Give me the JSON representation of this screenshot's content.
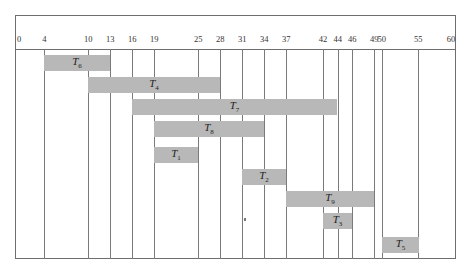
{
  "chart_data": {
    "type": "gantt",
    "title": "",
    "xlabel": "",
    "ylabel": "",
    "xlim": [
      0,
      60
    ],
    "grid": true,
    "tick_labels": [
      0,
      4,
      10,
      13,
      16,
      19,
      25,
      28,
      31,
      34,
      37,
      42,
      44,
      46,
      49,
      50,
      55,
      60
    ],
    "tasks": [
      {
        "name": "T6",
        "base": "T",
        "sub": "6",
        "start": 4,
        "end": 13
      },
      {
        "name": "T4",
        "base": "T",
        "sub": "4",
        "start": 10,
        "end": 28
      },
      {
        "name": "T7",
        "base": "T",
        "sub": "7",
        "start": 16,
        "end": 44
      },
      {
        "name": "T8",
        "base": "T",
        "sub": "8",
        "start": 19,
        "end": 34
      },
      {
        "name": "T1",
        "base": "T",
        "sub": "1",
        "start": 19,
        "end": 25
      },
      {
        "name": "T2",
        "base": "T",
        "sub": "2",
        "start": 31,
        "end": 37
      },
      {
        "name": "T9",
        "base": "T",
        "sub": "9",
        "start": 37,
        "end": 49
      },
      {
        "name": "T3",
        "base": "T",
        "sub": "3",
        "start": 42,
        "end": 46
      },
      {
        "name": "T5",
        "base": "T",
        "sub": "5",
        "start": 50,
        "end": 55
      }
    ],
    "colors": {
      "bar": "#b8b8b8",
      "grid": "#7a7a7a",
      "frame": "#6e6e6e"
    }
  }
}
